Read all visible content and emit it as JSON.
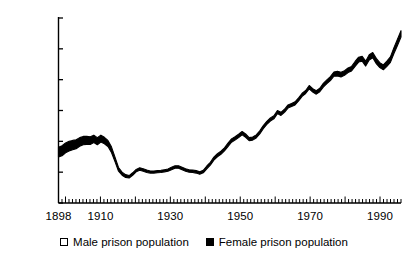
{
  "chart_data": {
    "type": "area",
    "title": "",
    "subtitle": "",
    "xlabel": "",
    "ylabel": "",
    "xlim": [
      1898,
      1996
    ],
    "ylim": [
      0,
      60000
    ],
    "grid": false,
    "legend_position": "bottom-center",
    "y_ticks": [
      0,
      10000,
      20000,
      30000,
      40000,
      50000,
      60000
    ],
    "y_tick_labels": [
      "0",
      "10,000",
      "20,000",
      "30,000",
      "40,000",
      "50,000",
      "60,000"
    ],
    "x_ticks": [
      1898,
      1910,
      1930,
      1950,
      1970,
      1990
    ],
    "x_tick_labels": [
      "1898",
      "1910",
      "1930",
      "1950",
      "1970",
      "1990"
    ],
    "x_minor_tick_interval": 1,
    "series": [
      {
        "name": "Male prison population",
        "swatch": "hollow",
        "color": "#ffffff",
        "values": [
          14900,
          15300,
          16300,
          16900,
          17300,
          17600,
          18400,
          18900,
          19000,
          19000,
          19600,
          18900,
          19800,
          19200,
          18300,
          16400,
          13400,
          10300,
          9000,
          8300,
          8100,
          9000,
          10100,
          10600,
          10300,
          9900,
          9700,
          9700,
          9800,
          9900,
          10100,
          10300,
          10800,
          11300,
          11300,
          10800,
          10300,
          10000,
          9900,
          9700,
          9300,
          9800,
          11100,
          12300,
          13900,
          15000,
          15800,
          16900,
          18300,
          19700,
          20400,
          21200,
          22100,
          21300,
          20200,
          20400,
          21100,
          22400,
          24100,
          25500,
          26600,
          27300,
          29000,
          28400,
          29400,
          30800,
          31300,
          31800,
          33100,
          34600,
          35500,
          37000,
          36000,
          35300,
          36100,
          37600,
          38700,
          39700,
          41100,
          41200,
          40900,
          41400,
          42300,
          42800,
          44300,
          45700,
          46000,
          44400,
          46400,
          47100,
          45200,
          43900,
          43200,
          44300,
          45600,
          48500,
          51100,
          53800
        ]
      },
      {
        "name": "Female prison population",
        "swatch": "filled",
        "color": "#000000",
        "values": [
          3200,
          3300,
          3200,
          3100,
          3000,
          2900,
          2800,
          2700,
          2600,
          2500,
          2400,
          2300,
          2200,
          2100,
          2000,
          1800,
          1500,
          1200,
          1000,
          900,
          800,
          800,
          800,
          800,
          800,
          800,
          700,
          700,
          700,
          700,
          700,
          700,
          800,
          800,
          800,
          800,
          800,
          800,
          800,
          800,
          800,
          800,
          900,
          900,
          1000,
          1000,
          1000,
          1000,
          1100,
          1100,
          1100,
          1100,
          1100,
          1100,
          1000,
          1000,
          1000,
          1000,
          1000,
          1000,
          1000,
          1000,
          1000,
          1000,
          1000,
          1000,
          1000,
          1000,
          1000,
          1000,
          1000,
          1100,
          1100,
          1100,
          1100,
          1200,
          1200,
          1300,
          1400,
          1500,
          1500,
          1500,
          1500,
          1500,
          1600,
          1600,
          1600,
          1600,
          1700,
          1700,
          1700,
          1600,
          1600,
          1700,
          1800,
          1900,
          2000,
          2100
        ]
      }
    ]
  },
  "legend": {
    "entries": [
      {
        "label": "Male prison population"
      },
      {
        "label": "Female prison population"
      }
    ]
  }
}
